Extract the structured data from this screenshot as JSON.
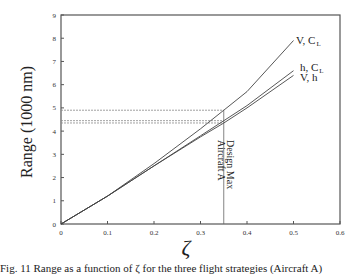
{
  "chart_data": {
    "type": "line",
    "title": "",
    "xlabel": "ζ",
    "ylabel": "Range (1000 nm)",
    "xlim": [
      0,
      0.6
    ],
    "ylim": [
      0,
      9
    ],
    "x_ticks": [
      "0",
      "0.1",
      "0.2",
      "0.3",
      "0.4",
      "0.5",
      "0.6"
    ],
    "y_ticks": [
      "0",
      "1",
      "2",
      "3",
      "4",
      "5",
      "6",
      "7",
      "8",
      "9"
    ],
    "grid": false,
    "legend": "inline labels at curve ends",
    "series": [
      {
        "name": "V, C_L",
        "label_main": "V, C",
        "label_sub": "L",
        "x": [
          0,
          0.1,
          0.2,
          0.3,
          0.35,
          0.4,
          0.5
        ],
        "y": [
          0,
          1.2,
          2.6,
          4.1,
          4.9,
          5.7,
          7.9
        ]
      },
      {
        "name": "h, C_L",
        "label_main": "h, C",
        "label_sub": "L",
        "x": [
          0,
          0.1,
          0.2,
          0.3,
          0.35,
          0.4,
          0.5
        ],
        "y": [
          0,
          1.2,
          2.5,
          3.8,
          4.45,
          5.1,
          6.6
        ]
      },
      {
        "name": "V, h",
        "label_main": "V, h",
        "label_sub": "",
        "x": [
          0,
          0.1,
          0.2,
          0.3,
          0.35,
          0.4,
          0.5
        ],
        "y": [
          0,
          1.2,
          2.5,
          3.75,
          4.35,
          5.0,
          6.4
        ]
      }
    ],
    "reference_lines": {
      "vertical": {
        "x": 0.35,
        "label_line1": "Design Max",
        "label_line2": "Aircraft A"
      },
      "horizontal": [
        4.9,
        4.45,
        4.35
      ]
    }
  },
  "caption": "Fig. 11 Range as a function of ζ for the three flight strategies (Aircraft A)"
}
